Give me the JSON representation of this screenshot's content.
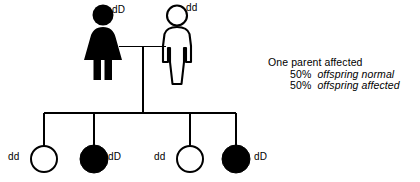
{
  "diagram": {
    "ink_color": "#000000",
    "background_color": "#ffffff"
  },
  "annotation": {
    "line1": "One parent affected",
    "line2_percent": "50%",
    "line2_text": "offspring normal",
    "line3_percent": "50%",
    "line3_text": "offspring affected"
  },
  "parents": {
    "mother": {
      "sex": "female",
      "affected": true,
      "genotype": "dD",
      "symbol": "filled-female-figure"
    },
    "father": {
      "sex": "male",
      "affected": false,
      "genotype": "dd",
      "symbol": "outline-male-figure"
    }
  },
  "offspring": [
    {
      "index": 1,
      "sex": "female",
      "affected": false,
      "genotype": "dd",
      "symbol": "open-circle"
    },
    {
      "index": 2,
      "sex": "female",
      "affected": true,
      "genotype": "dD",
      "symbol": "filled-circle"
    },
    {
      "index": 3,
      "sex": "female",
      "affected": false,
      "genotype": "dd",
      "symbol": "open-circle"
    },
    {
      "index": 4,
      "sex": "female",
      "affected": true,
      "genotype": "dD",
      "symbol": "filled-circle"
    }
  ]
}
